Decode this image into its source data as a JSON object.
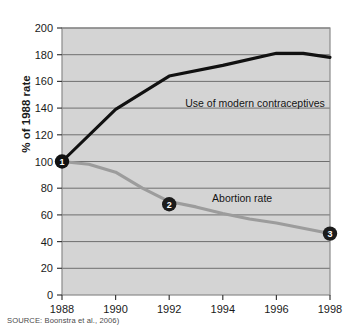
{
  "figure": {
    "source_note": "SOURCE: Boonstra et al., 2006)"
  },
  "chart_data": {
    "type": "line",
    "title": "",
    "subtitle": "",
    "xlabel": "",
    "ylabel": "% of 1988 rate",
    "xlim": [
      1988,
      1998
    ],
    "ylim": [
      0,
      200
    ],
    "grid": true,
    "gridlines_y": [
      0,
      20,
      40,
      60,
      80,
      100,
      120,
      140,
      160,
      180,
      200
    ],
    "legend_position": "inline-annotation",
    "xticks": [
      1988,
      1990,
      1992,
      1994,
      1996,
      1998
    ],
    "xtick_labels": [
      "1988",
      "1990",
      "1992",
      "1994",
      "1996",
      "1998"
    ],
    "yticks": [
      0,
      20,
      40,
      60,
      80,
      100,
      120,
      140,
      160,
      180,
      200
    ],
    "ytick_labels": [
      "0",
      "20",
      "40",
      "60",
      "80",
      "100",
      "120",
      "140",
      "160",
      "180",
      "200"
    ],
    "plot_background": "#d4d4d4",
    "series": [
      {
        "name": "Use of modern contraceptives",
        "color": "#111111",
        "label_x": 1992.6,
        "label_y": 141,
        "x": [
          1988,
          1990,
          1992,
          1994,
          1996,
          1997,
          1998
        ],
        "values": [
          100,
          139,
          164,
          172,
          181,
          181,
          178
        ]
      },
      {
        "name": "Abortion rate",
        "color": "#9c9c9c",
        "label_x": 1993.6,
        "label_y": 70,
        "x": [
          1988,
          1989,
          1990,
          1991,
          1992,
          1993,
          1994,
          1995,
          1996,
          1997,
          1998
        ],
        "values": [
          100,
          98,
          92,
          80,
          70,
          66,
          61,
          57,
          54,
          50,
          46
        ]
      }
    ],
    "annotations": [
      {
        "label": "1",
        "x": 1988,
        "y": 100,
        "color": "#111111"
      },
      {
        "label": "2",
        "x": 1992,
        "y": 68,
        "color": "#1c1c1c"
      },
      {
        "label": "3",
        "x": 1998,
        "y": 46,
        "color": "#1c1c1c"
      }
    ]
  }
}
